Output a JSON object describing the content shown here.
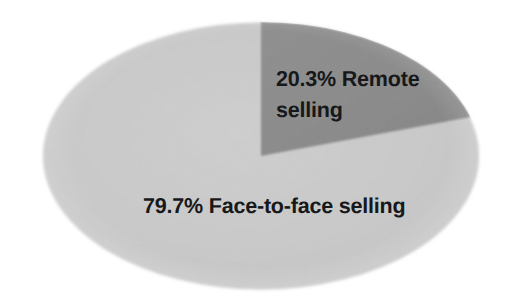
{
  "chart_data": {
    "type": "pie",
    "title": "",
    "subtitle": "",
    "xlabel": "",
    "ylabel": "",
    "grid": false,
    "legend_position": "none",
    "labels_inside_slices": true,
    "start_angle_deg": 0,
    "direction": "clockwise",
    "slices": [
      {
        "label": "Remote selling",
        "value": 20.3,
        "unit": "%",
        "value_text": "20.3%",
        "data_label": "20.3% Remote selling",
        "data_label_line1": "20.3% Remote",
        "data_label_line2": "selling",
        "color": "#8b8b8b"
      },
      {
        "label": "Face-to-face selling",
        "value": 79.7,
        "unit": "%",
        "value_text": "79.7%",
        "data_label": "79.7% Face-to-face selling",
        "data_label_line1": "79.7% Face-to-face selling",
        "data_label_line2": "",
        "color": "#c9c9c9"
      }
    ],
    "categories": [
      "Remote selling",
      "Face-to-face selling"
    ],
    "values": [
      20.3,
      79.7
    ],
    "total": 100.0
  },
  "figure": {
    "background_color": "#ffffff",
    "shape": "ellipse"
  }
}
